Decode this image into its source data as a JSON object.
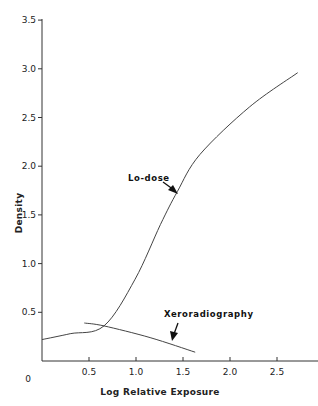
{
  "chart_data": {
    "type": "line",
    "title": "",
    "xlabel": "Log Relative Exposure",
    "ylabel": "Density",
    "xlim": [
      0,
      2.8
    ],
    "ylim": [
      0,
      3.5
    ],
    "x_ticks": [
      0.5,
      1.0,
      1.5,
      2.0,
      2.5
    ],
    "x_tick_labels": [
      "0.5",
      "1.0",
      "1.5",
      "2.0",
      "2.5"
    ],
    "y_ticks": [
      0,
      0.5,
      1.0,
      1.5,
      2.0,
      2.5,
      3.0,
      3.5
    ],
    "y_tick_labels": [
      "0",
      "0.5",
      "1.0",
      "1.5",
      "2.0",
      "2.5",
      "3.0",
      "3.5"
    ],
    "grid": false,
    "legend": "none (inline annotations with arrows)",
    "series": [
      {
        "name": "Lo-dose",
        "x": [
          0.0,
          0.3,
          0.66,
          0.99,
          1.26,
          1.44,
          1.68,
          2.21,
          2.72
        ],
        "y": [
          0.22,
          0.28,
          0.36,
          0.84,
          1.4,
          1.74,
          2.12,
          2.61,
          2.96
        ]
      },
      {
        "name": "Xeroradiography",
        "x": [
          0.45,
          0.66,
          1.15,
          1.63
        ],
        "y": [
          0.39,
          0.36,
          0.24,
          0.09
        ]
      }
    ],
    "annotations": [
      {
        "text": "Lo-dose",
        "points_to": [
          1.44,
          1.74
        ]
      },
      {
        "text": "Xeroradiography",
        "points_to": [
          1.38,
          0.21
        ]
      }
    ]
  },
  "labels": {
    "xlabel": "Log Relative Exposure",
    "ylabel": "Density",
    "lodose": "Lo-dose",
    "xero": "Xeroradiography",
    "origin": "0"
  }
}
